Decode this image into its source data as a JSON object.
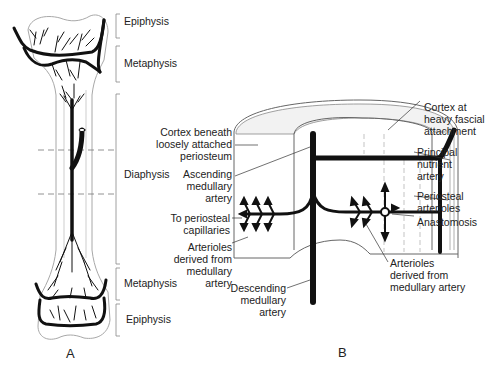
{
  "panel_a": {
    "caption": "A",
    "labels": {
      "epiphysis_top": "Epiphysis",
      "metaphysis_top": "Metaphysis",
      "diaphysis": "Diaphysis",
      "metaphysis_bottom": "Metaphysis",
      "epiphysis_bottom": "Epiphysis"
    }
  },
  "panel_b": {
    "caption": "B",
    "labels": {
      "cortex_loose": "Cortex beneath\nloosely attached\nperiosteum",
      "ascending": "Ascending\nmedullary\nartery",
      "to_periosteal": "To periosteal\ncapillaries",
      "arterioles_left": "Arterioles\nderived from\nmedullary\nartery",
      "descending": "Descending\nmedullary\nartery",
      "cortex_fascial": "Cortex at\nheavy fascial\nattachment",
      "principal": "Principal\nnutrient\nartery",
      "periosteal_arterioles": "Periosteal\narterioles",
      "anastomosis": "Anastomosis",
      "arterioles_right": "Arterioles\nderived from\nmedullary artery"
    }
  },
  "colors": {
    "ink": "#111111",
    "outline": "#9a9a9a",
    "bone_fill": "#f4f4f4"
  }
}
